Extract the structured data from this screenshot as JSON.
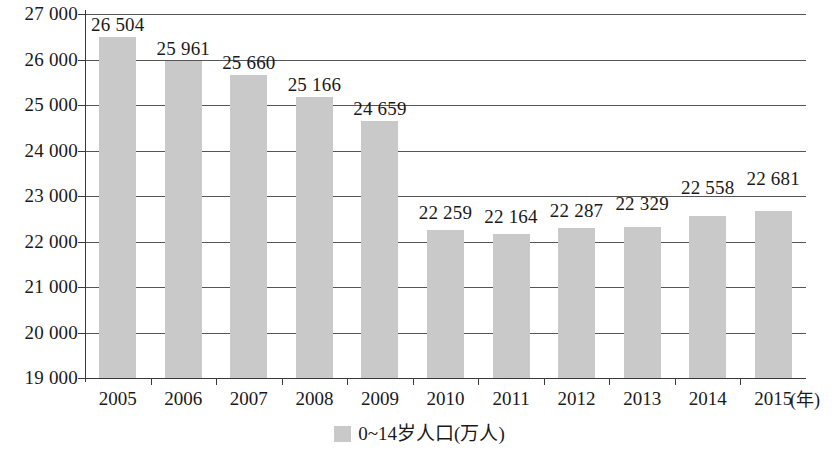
{
  "chart_data": {
    "type": "bar",
    "title": "",
    "xlabel": "(年)",
    "ylabel": "",
    "categories": [
      "2005",
      "2006",
      "2007",
      "2008",
      "2009",
      "2010",
      "2011",
      "2012",
      "2013",
      "2014",
      "2015"
    ],
    "values": [
      26504,
      25961,
      25660,
      25166,
      24659,
      22259,
      22164,
      22287,
      22329,
      22558,
      22681
    ],
    "value_labels": [
      "26 504",
      "25 961",
      "25 660",
      "25 166",
      "24 659",
      "22 259",
      "22 164",
      "22 287",
      "22 329",
      "22 558",
      "22 681"
    ],
    "ylim": [
      19000,
      27000
    ],
    "y_ticks": [
      19000,
      20000,
      21000,
      22000,
      23000,
      24000,
      25000,
      26000,
      27000
    ],
    "y_tick_labels": [
      "19 000",
      "20 000",
      "21 000",
      "22 000",
      "23 000",
      "24 000",
      "25 000",
      "26 000",
      "27 000"
    ],
    "grid": true,
    "legend": [
      {
        "label": "0~14岁人口(万人)",
        "color": "#c9c9c9"
      }
    ],
    "legend_position": "bottom-center",
    "bar_color": "#c9c9c9",
    "grid_color": "#555555",
    "axis_color": "#3a3a3a"
  }
}
